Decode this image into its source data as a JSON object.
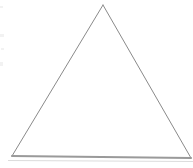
{
  "figure": {
    "background_color": "#ffffff",
    "canvas": {
      "width": 193,
      "height": 168
    },
    "shape": {
      "name": "triangle",
      "type": "polygon",
      "fill": "none",
      "stroke_color": "#8a8a8a",
      "baseline_stroke_color": "#9a9a9a",
      "stroke_width": 1,
      "baseline_stroke_width": 2,
      "vertices": [
        {
          "label": "apex",
          "x": 103,
          "y": 5
        },
        {
          "label": "bottom-right",
          "x": 191,
          "y": 158
        },
        {
          "label": "bottom-left",
          "x": 12,
          "y": 156
        }
      ],
      "edges": [
        {
          "name": "left-edge",
          "from": "apex",
          "to": "bottom-left"
        },
        {
          "name": "right-edge",
          "from": "apex",
          "to": "bottom-right"
        },
        {
          "name": "base-edge",
          "from": "bottom-left",
          "to": "bottom-right"
        }
      ]
    },
    "shadow": {
      "name": "baseline-shadow",
      "color": "#dcdcdc",
      "y": 160,
      "x_start": 8,
      "x_end": 193,
      "height": 1
    },
    "artifacts": [
      {
        "name": "scan-artifact-1",
        "x": 0,
        "y": 6,
        "width": 3,
        "height": 2
      },
      {
        "name": "scan-artifact-2",
        "x": 0,
        "y": 34,
        "width": 4,
        "height": 3
      },
      {
        "name": "scan-artifact-3",
        "x": 1,
        "y": 48,
        "width": 3,
        "height": 2
      },
      {
        "name": "scan-artifact-4",
        "x": 0,
        "y": 62,
        "width": 3,
        "height": 4
      }
    ]
  }
}
